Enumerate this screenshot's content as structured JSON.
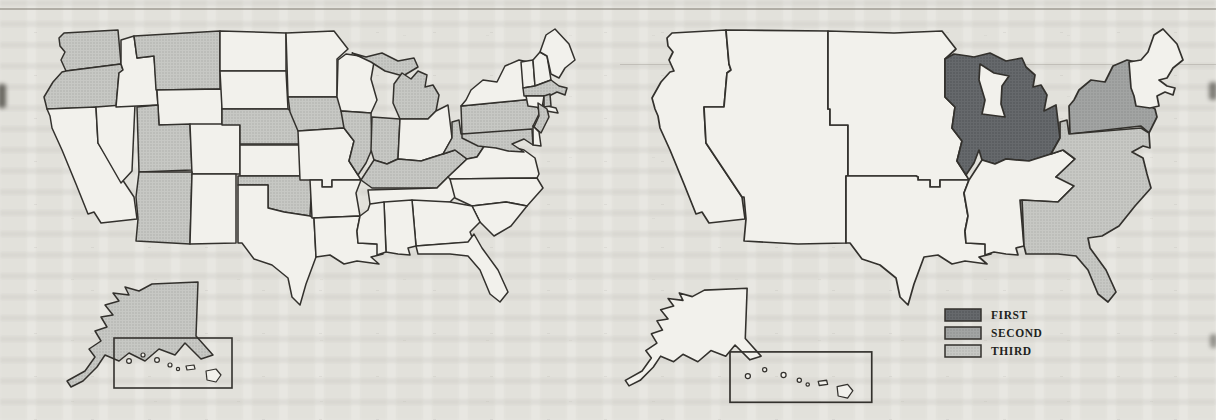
{
  "colors": {
    "paper": "#e8e7e2",
    "map_unshaded": "#f2f1ec",
    "outline": "#33312d",
    "shade_base": "#c7c8c4",
    "shade_dot": "#a8a9a5",
    "first_base": "#66696c",
    "first_dot": "#4d5053",
    "second_base": "#a2a4a3",
    "second_dot": "#8a8c8b",
    "third_base": "#c7c8c4",
    "third_dot": "#adaeaa"
  },
  "left_map": {
    "description": "us-map-states-shaded",
    "shaded_states": [
      "WA",
      "OR",
      "MT",
      "UT",
      "AZ",
      "NE",
      "OK",
      "IA",
      "IL",
      "IN",
      "MI",
      "KY",
      "WV",
      "PA",
      "NJ",
      "MD",
      "MA",
      "RI",
      "AK"
    ]
  },
  "right_map": {
    "description": "us-map-census-divisions-ranked",
    "divisions": [
      {
        "id": "pacific",
        "rank": "none"
      },
      {
        "id": "mountain",
        "rank": "none"
      },
      {
        "id": "west-north-central",
        "rank": "none"
      },
      {
        "id": "west-south-central",
        "rank": "none"
      },
      {
        "id": "east-north-central",
        "rank": "first"
      },
      {
        "id": "east-south-central",
        "rank": "none"
      },
      {
        "id": "middle-atlantic",
        "rank": "second"
      },
      {
        "id": "new-england",
        "rank": "none"
      },
      {
        "id": "south-atlantic",
        "rank": "third"
      },
      {
        "id": "alaska",
        "rank": "none"
      },
      {
        "id": "hawaii",
        "rank": "none"
      }
    ]
  },
  "legend": {
    "items": [
      {
        "label": "FIRST",
        "rank": "first",
        "color": "#66696c"
      },
      {
        "label": "SECOND",
        "rank": "second",
        "color": "#a2a4a3"
      },
      {
        "label": "THIRD",
        "rank": "third",
        "color": "#c7c8c4"
      }
    ]
  }
}
